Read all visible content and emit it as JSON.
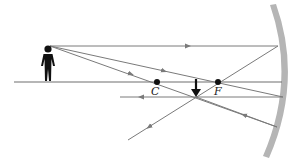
{
  "diagram": {
    "type": "concave-mirror-ray-diagram",
    "labels": {
      "center_of_curvature": "C",
      "focal_point": "F"
    },
    "colors": {
      "ray": "#7a7a7a",
      "mirror": "#b5b5b5",
      "axis": "#6e6e6e",
      "object": "#111111",
      "point": "#111111"
    },
    "points": {
      "C": [
        157,
        82
      ],
      "F": [
        218,
        82
      ]
    },
    "object": {
      "kind": "person-figure",
      "head": [
        48,
        46
      ],
      "feet": [
        48,
        81
      ]
    },
    "image": {
      "kind": "inverted-arrow",
      "top": [
        196,
        79
      ],
      "tip": [
        196,
        96
      ]
    }
  }
}
